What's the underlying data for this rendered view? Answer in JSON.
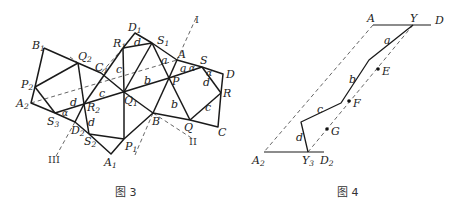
{
  "figure3": {
    "caption": "图 3",
    "points": {
      "D1": "D",
      "R1": "R",
      "S1": "S",
      "A": "A",
      "S": "S",
      "D": "D",
      "R": "R",
      "C": "C",
      "Q": "Q",
      "B": "B",
      "P": "P",
      "Q1": "Q",
      "P1": "P",
      "A1": "A",
      "S2": "S",
      "D2": "D",
      "R2": "R",
      "S3": "S",
      "A2": "A",
      "P2": "P",
      "B1": "B",
      "Q2": "Q",
      "C1": "C"
    },
    "subscripts": {
      "D1": "1",
      "R1": "1",
      "S1": "1",
      "Q1": "1",
      "P1": "1",
      "A1": "1",
      "S2": "2",
      "D2": "2",
      "R2": "2",
      "S3": "3",
      "A2": "2",
      "P2": "2",
      "B1": "1",
      "Q2": "2",
      "C1": "1"
    },
    "segment_labels": {
      "a_top": "a",
      "a_mid": "a",
      "alpha_1": "α",
      "alpha_2": "α",
      "alpha_3": "α",
      "d_top": "d",
      "d_right": "d",
      "d_left": "d",
      "d_lower": "d",
      "b_mid": "b",
      "b_lower": "b",
      "c_left": "c",
      "c_mid": "c",
      "c_right": "c"
    },
    "axes": {
      "I": "I",
      "II": "II",
      "III": "III"
    }
  },
  "figure4": {
    "caption": "图 4",
    "points": {
      "A": "A",
      "Y": "Y",
      "D": "D",
      "E": "E",
      "F": "F",
      "G": "G",
      "A2": "A",
      "Y3": "Y",
      "D2": "D"
    },
    "subscripts": {
      "A2": "2",
      "Y3": "3",
      "D2": "2"
    },
    "segment_labels": {
      "a": "a",
      "b": "b",
      "c": "c",
      "d": "d"
    }
  }
}
